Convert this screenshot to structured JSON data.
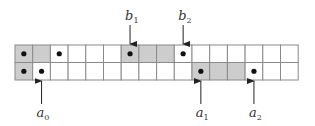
{
  "diagram": {
    "type": "array-pointer-diagram",
    "grid": {
      "rows": 2,
      "cols": 16,
      "origin_x": 15,
      "origin_y": 45,
      "cell_w": 17.7,
      "cell_h": 17.5,
      "line_color": "#8a8a8a",
      "shade_color": "#cdcdcd",
      "dot_color": "#111111"
    },
    "row_0": {
      "shaded": [
        0,
        1,
        6,
        7,
        8
      ],
      "dots": [
        0,
        2,
        6,
        9
      ]
    },
    "row_1": {
      "shaded": [
        0,
        10,
        11,
        12
      ],
      "dots": [
        0,
        1,
        10,
        13
      ]
    },
    "pointers_top": [
      {
        "name": "b",
        "sub": "1",
        "row": 0,
        "col": 6
      },
      {
        "name": "b",
        "sub": "2",
        "row": 0,
        "col": 9
      }
    ],
    "pointers_bottom": [
      {
        "name": "a",
        "sub": "0",
        "row": 1,
        "col": 1
      },
      {
        "name": "a",
        "sub": "1",
        "row": 1,
        "col": 10
      },
      {
        "name": "a",
        "sub": "2",
        "row": 1,
        "col": 13
      }
    ]
  }
}
